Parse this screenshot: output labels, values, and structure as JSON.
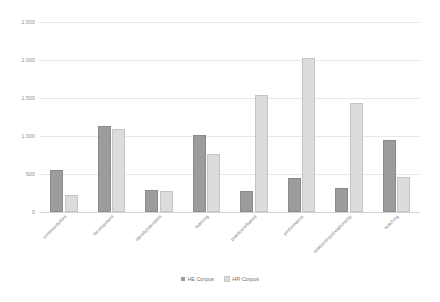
{
  "chart_data": {
    "type": "bar",
    "title": "",
    "subtitle": "",
    "xlabel": "",
    "ylabel": "",
    "ylim": [
      0,
      2500
    ],
    "yticks": [
      "0",
      "500",
      "1.000",
      "1.500",
      "2.000",
      "2.500"
    ],
    "ytick_values": [
      0,
      500,
      1000,
      1500,
      2000,
      2500
    ],
    "grid": true,
    "legend_position": "bottom",
    "categories": [
      "community/ties",
      "development",
      "identity/identities",
      "learning",
      "practice/s/based",
      "performance",
      "relationships/relationship",
      "teaching"
    ],
    "series": [
      {
        "name": "HE Corpus",
        "color": "#9c9c9c",
        "values": [
          525,
          1105,
          265,
          990,
          255,
          420,
          290,
          920
        ]
      },
      {
        "name": "HR Corpus",
        "color": "#dcdcdc",
        "values": [
          200,
          1065,
          245,
          740,
          1515,
          2000,
          1410,
          430
        ]
      }
    ]
  },
  "legend": {
    "entries": [
      {
        "label": "HE Corpus"
      },
      {
        "label": "HR Corpus"
      }
    ]
  }
}
